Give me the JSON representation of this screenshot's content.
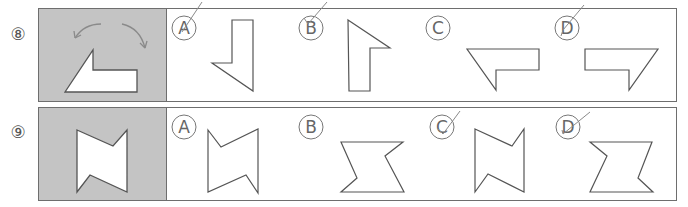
{
  "questions": [
    {
      "number": "⑧",
      "given_shape": "L-shaped polygon with slanted side; rotation arrows shown above",
      "options": [
        {
          "letter": "A",
          "marked": true
        },
        {
          "letter": "B",
          "marked": true
        },
        {
          "letter": "C",
          "marked": false
        },
        {
          "letter": "D",
          "marked": true
        }
      ]
    },
    {
      "number": "⑨",
      "given_shape": "bow-tie polygon with notches",
      "options": [
        {
          "letter": "A",
          "marked": false
        },
        {
          "letter": "B",
          "marked": false
        },
        {
          "letter": "C",
          "marked": true
        },
        {
          "letter": "D",
          "marked": true
        }
      ]
    }
  ],
  "colors": {
    "panel_gray": "#c4c4c4",
    "border": "#6e6e6e",
    "shape_stroke": "#555555",
    "pen_mark": "#8a8a8a"
  }
}
